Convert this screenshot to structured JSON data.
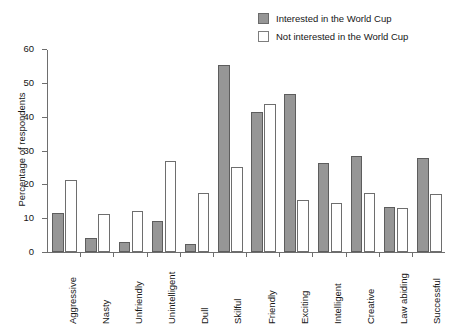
{
  "chart_data": {
    "type": "bar",
    "title": "",
    "subtitle": "",
    "xlabel": "",
    "ylabel": "Percentage of respondents",
    "ylim": [
      0,
      60
    ],
    "yticks": [
      0,
      10,
      20,
      30,
      40,
      50,
      60
    ],
    "ytick_labels": [
      "0",
      "10",
      "20",
      "30",
      "40",
      "50",
      "60"
    ],
    "grid": false,
    "legend_position": "top-right",
    "orientation": "vertical",
    "grouping": "grouped",
    "xtick_label_rotation": 90,
    "categories": [
      "Aggressive",
      "Nasty",
      "Unfriendly",
      "Unintelligent",
      "Dull",
      "Skilful",
      "Friendly",
      "Exciting",
      "Intelligent",
      "Creative",
      "Law abiding",
      "Successful"
    ],
    "series": [
      {
        "name": "Interested in the World Cup",
        "color": "#969696",
        "border_color": "#5d5d5d",
        "values": [
          11.5,
          4.0,
          3.1,
          9.2,
          2.5,
          55.3,
          41.4,
          46.7,
          26.4,
          28.5,
          13.2,
          27.8
        ]
      },
      {
        "name": "Not interested in the World Cup",
        "color": "#ffffff",
        "border_color": "#6e6e6e",
        "values": [
          21.3,
          11.2,
          12.1,
          27.0,
          17.4,
          25.0,
          43.8,
          15.4,
          14.5,
          17.4,
          12.9,
          17.0
        ]
      }
    ]
  },
  "legend": {
    "items": [
      {
        "label": "Interested in the World Cup",
        "swatch": "filled"
      },
      {
        "label": "Not interested in the World Cup",
        "swatch": "open"
      }
    ]
  },
  "axes": {
    "y_title": "Percentage of respondents"
  },
  "colors": {
    "interested_fill": "#969696",
    "interested_border": "#5d5d5d",
    "not_interested_fill": "#ffffff",
    "not_interested_border": "#6e6e6e",
    "axis": "#6e6e6e",
    "text": "#161616",
    "background": "#ffffff"
  }
}
